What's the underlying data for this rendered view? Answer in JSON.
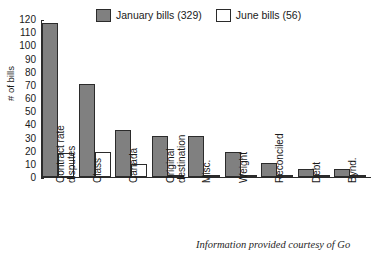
{
  "chart_data": {
    "type": "bar",
    "title": "",
    "xlabel": "",
    "ylabel": "# of bills",
    "ylim": [
      0,
      120
    ],
    "yticks": [
      0,
      10,
      20,
      30,
      40,
      50,
      60,
      70,
      80,
      90,
      100,
      110,
      120
    ],
    "grid": false,
    "legend_position": "top",
    "categories": [
      "Contract rate disputes",
      "Class",
      "Canada",
      "Original destination",
      "Misc.",
      "Weight",
      "Reconciled",
      "Debt",
      "Bynd."
    ],
    "category_lines": [
      [
        "Contract rate",
        "disputes"
      ],
      [
        "Class"
      ],
      [
        "Canada"
      ],
      [
        "Original",
        "destination"
      ],
      [
        "Misc."
      ],
      [
        "Weight"
      ],
      [
        "Reconciled"
      ],
      [
        "Debt"
      ],
      [
        "Bynd."
      ]
    ],
    "series": [
      {
        "name": "January bills (329)",
        "total": 329,
        "color": "#808080",
        "values": [
          117,
          71,
          36,
          31,
          31,
          19,
          11,
          6,
          6
        ]
      },
      {
        "name": "June bills (56)",
        "total": 56,
        "color": "#ffffff",
        "values": [
          18,
          19,
          10,
          1,
          1,
          1,
          1,
          1,
          1
        ]
      }
    ]
  },
  "legend": {
    "items": [
      {
        "label": "January bills (329)",
        "swatch": "#808080"
      },
      {
        "label": "June bills (56)",
        "swatch": "#ffffff"
      }
    ]
  },
  "footer": {
    "note": "Information provided courtesy of Go"
  }
}
